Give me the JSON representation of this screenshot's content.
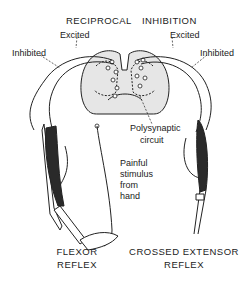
{
  "title_parts": [
    "RECIPROCAL",
    "INHIBITION"
  ],
  "labels": {
    "excited_left": "Excited",
    "excited_right": "Excited",
    "inhibited_left": "Inhibited",
    "inhibited_right": "Inhibited",
    "polysynaptic_line1": "Polysynaptic",
    "polysynaptic_line2": "circuit",
    "stimulus_line1": "Painful",
    "stimulus_line2": "stimulus",
    "stimulus_line3": "from",
    "stimulus_line4": "hand"
  },
  "captions": {
    "flexor_line1": "FLEXOR",
    "flexor_line2": "REFLEX",
    "crossed_line1": "CROSSED EXTENSOR",
    "crossed_line2": "REFLEX"
  },
  "colors": {
    "line": "#222222",
    "cord_fill": "#e6e6e6",
    "muscle": "#2a2a2a"
  }
}
